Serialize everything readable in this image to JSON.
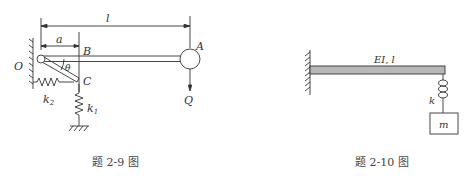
{
  "figure_left": {
    "caption": "题 2-9 图",
    "labels": {
      "l": "l",
      "a": "a",
      "O": "O",
      "A": "A",
      "B": "B",
      "C": "C",
      "theta": "θ",
      "k2": "k",
      "k2_sub": "2",
      "k1": "k",
      "k1_sub": "1",
      "Q": "Q"
    }
  },
  "figure_right": {
    "caption": "题 2-10 图",
    "labels": {
      "beam": "EI, l",
      "k": "k",
      "m": "m"
    }
  },
  "colors": {
    "line": "#333333",
    "beam_fill": "#b8b8b8",
    "text": "#333333"
  }
}
